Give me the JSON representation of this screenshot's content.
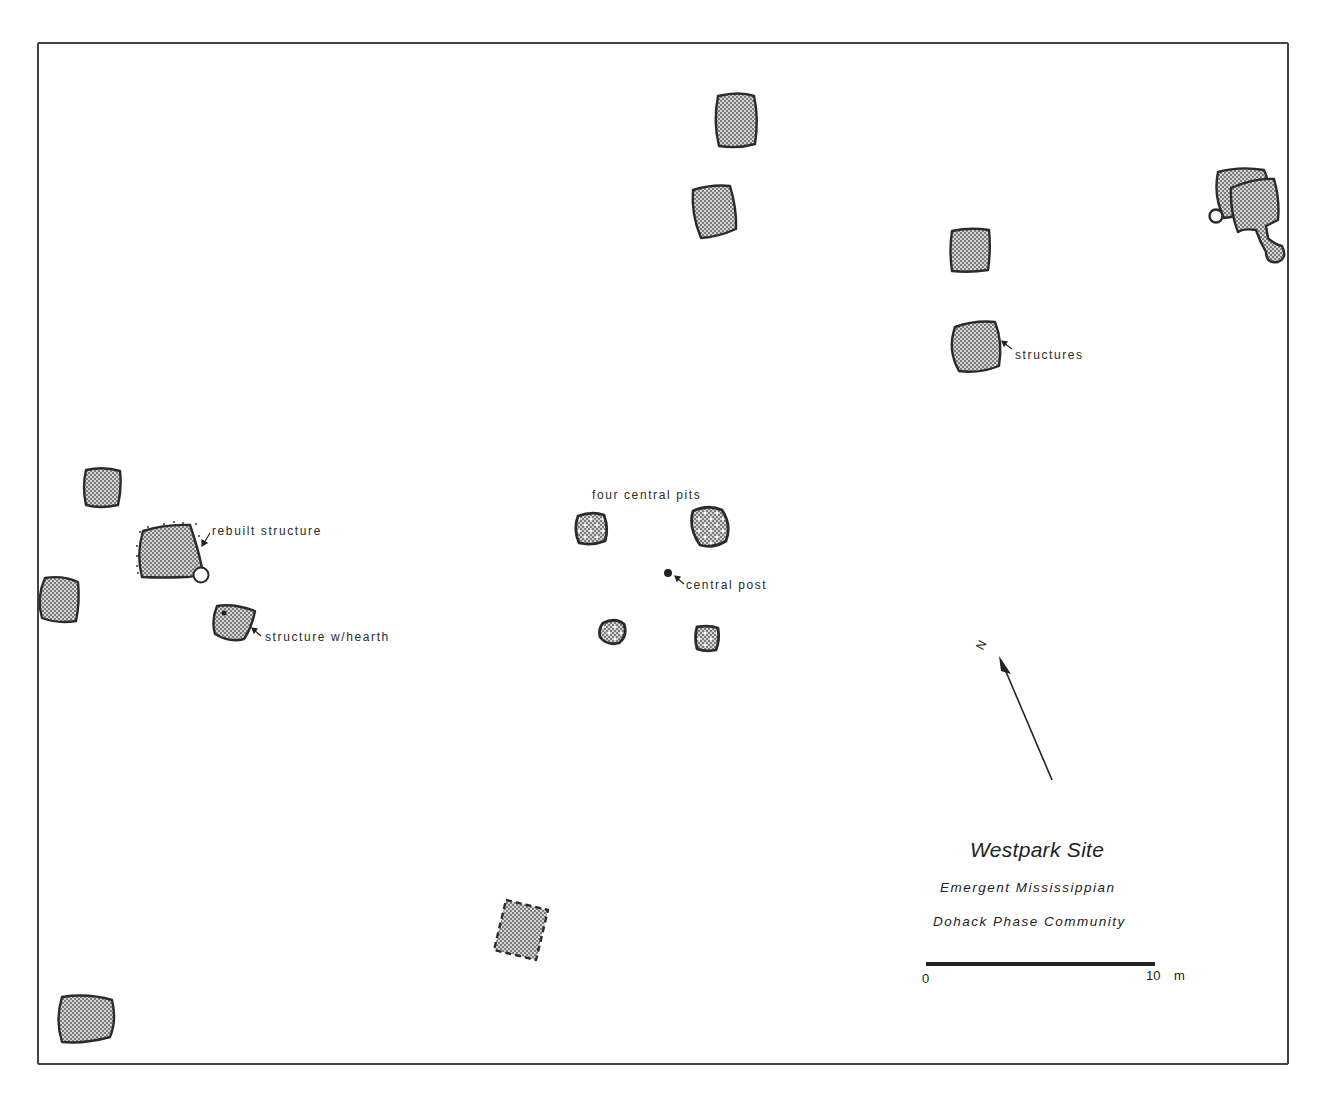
{
  "map": {
    "title": "Westpark Site",
    "subtitle_line1": "Emergent Mississippian",
    "subtitle_line2": "Dohack Phase Community",
    "north_label": "N",
    "scale_bar": {
      "start_label": "0",
      "end_label": "10",
      "unit": "m",
      "length_m": 10
    },
    "labels": {
      "structures": "structures",
      "four_central_pits": "four central pits",
      "central_post": "central post",
      "rebuilt_structure": "rebuilt structure",
      "structure_with_hearth": "structure w/hearth"
    },
    "features": [
      {
        "type": "structure",
        "id": "north-structure-1"
      },
      {
        "type": "structure",
        "id": "north-structure-2"
      },
      {
        "type": "structure",
        "id": "northeast-structure-1"
      },
      {
        "type": "structure",
        "id": "northeast-structure-2-labeled"
      },
      {
        "type": "structure-complex",
        "id": "east-edge-overlapping-structures"
      },
      {
        "type": "structure",
        "id": "west-structure-1"
      },
      {
        "type": "rebuilt-structure",
        "id": "west-rebuilt-structure"
      },
      {
        "type": "structure",
        "id": "west-edge-structure"
      },
      {
        "type": "structure-with-hearth",
        "id": "west-hearth-structure"
      },
      {
        "type": "central-pit",
        "id": "pit-nw"
      },
      {
        "type": "central-pit",
        "id": "pit-ne"
      },
      {
        "type": "central-pit",
        "id": "pit-sw"
      },
      {
        "type": "central-pit",
        "id": "pit-se"
      },
      {
        "type": "central-post",
        "id": "central-post"
      },
      {
        "type": "structure-dashed",
        "id": "south-dashed-structure"
      },
      {
        "type": "structure",
        "id": "southwest-structure"
      }
    ],
    "colors": {
      "outline": "#2b2b2b",
      "fill_stipple": "#8a8a8a",
      "background": "#ffffff"
    }
  }
}
